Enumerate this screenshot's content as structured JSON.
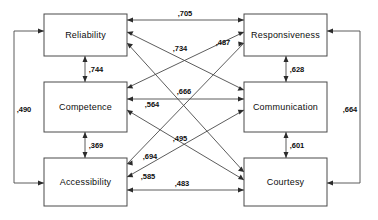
{
  "diagram": {
    "type": "path-correlation-diagram",
    "decimal_separator": ",",
    "nodes": [
      {
        "id": "reliability",
        "label": "Reliability",
        "column": "left",
        "row": 0
      },
      {
        "id": "competence",
        "label": "Competence",
        "column": "left",
        "row": 1
      },
      {
        "id": "accessibility",
        "label": "Accessibility",
        "column": "left",
        "row": 2
      },
      {
        "id": "responsiveness",
        "label": "Responsiveness",
        "column": "right",
        "row": 0
      },
      {
        "id": "communication",
        "label": "Communication",
        "column": "right",
        "row": 1
      },
      {
        "id": "courtesy",
        "label": "Courtesy",
        "column": "right",
        "row": 2
      }
    ],
    "edges": [
      {
        "id": "e-rel-resp",
        "from": "reliability",
        "to": "responsiveness",
        "value": ",705",
        "kind": "horizontal-top"
      },
      {
        "id": "e-comp-comm",
        "from": "competence",
        "to": "communication",
        "value": ",564",
        "kind": "horizontal-middle"
      },
      {
        "id": "e-acc-cour",
        "from": "accessibility",
        "to": "courtesy",
        "value": ",483",
        "kind": "horizontal-bottom"
      },
      {
        "id": "e-rel-comp",
        "from": "reliability",
        "to": "competence",
        "value": ",744",
        "kind": "vertical-left"
      },
      {
        "id": "e-comp-acc",
        "from": "competence",
        "to": "accessibility",
        "value": ",369",
        "kind": "vertical-left"
      },
      {
        "id": "e-resp-comm",
        "from": "responsiveness",
        "to": "communication",
        "value": ",628",
        "kind": "vertical-right"
      },
      {
        "id": "e-comm-cour",
        "from": "communication",
        "to": "courtesy",
        "value": ",601",
        "kind": "vertical-right"
      },
      {
        "id": "e-rel-acc",
        "from": "reliability",
        "to": "accessibility",
        "value": ",490",
        "kind": "outer-left"
      },
      {
        "id": "e-resp-cour",
        "from": "responsiveness",
        "to": "courtesy",
        "value": ",664",
        "kind": "outer-right"
      },
      {
        "id": "e-rel-comm",
        "from": "reliability",
        "to": "communication",
        "value": ",734",
        "kind": "diagonal"
      },
      {
        "id": "e-rel-cour",
        "from": "reliability",
        "to": "courtesy",
        "value": ",666",
        "kind": "diagonal"
      },
      {
        "id": "e-comp-resp",
        "from": "competence",
        "to": "responsiveness",
        "value": ",487",
        "kind": "diagonal"
      },
      {
        "id": "e-comp-cour",
        "from": "competence",
        "to": "courtesy",
        "value": ",495",
        "kind": "diagonal"
      },
      {
        "id": "e-acc-resp",
        "from": "accessibility",
        "to": "responsiveness",
        "value": ",694",
        "kind": "diagonal"
      },
      {
        "id": "e-acc-comm",
        "from": "accessibility",
        "to": "communication",
        "value": ",585",
        "kind": "diagonal"
      }
    ],
    "colors": {
      "background": "#ffffff",
      "box_stroke": "#4a4a4a",
      "edge_stroke": "#4a4a4a",
      "text": "#0d0d0d"
    }
  }
}
